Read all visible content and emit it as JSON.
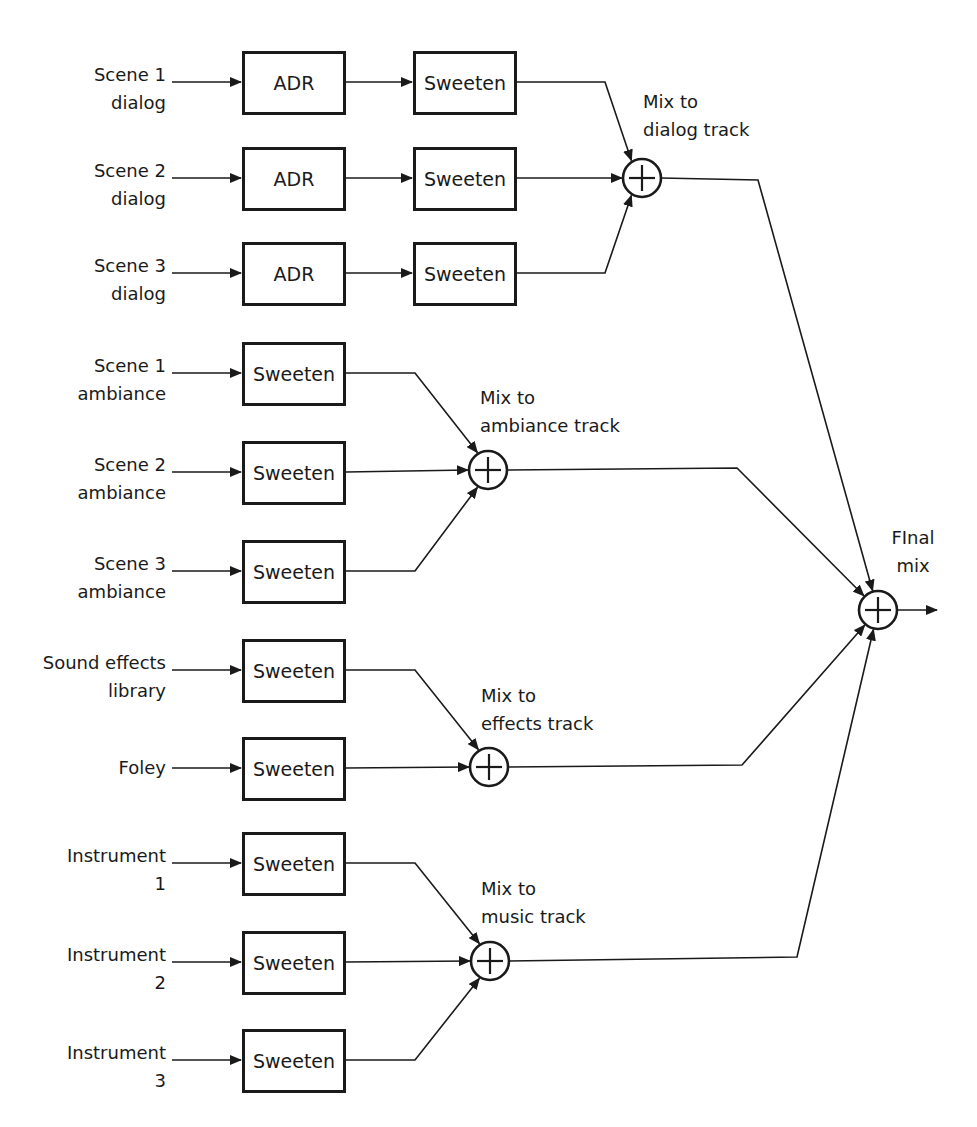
{
  "diagram": {
    "colors": {
      "stroke": "#1a1a1a",
      "background": "#ffffff"
    },
    "groups": [
      {
        "name": "dialog",
        "sum_label": [
          "Mix to",
          "dialog track"
        ],
        "sum": {
          "cx": 642,
          "cy": 178
        },
        "label_pos": {
          "x": 643,
          "y": 88
        },
        "out_corner": {
          "x": 758,
          "y": 180
        },
        "inputs": [
          {
            "label": [
              "Scene 1",
              "dialog"
            ],
            "y": 82,
            "stages": [
              "ADR",
              "Sweeten"
            ]
          },
          {
            "label": [
              "Scene 2",
              "dialog"
            ],
            "y": 178,
            "stages": [
              "ADR",
              "Sweeten"
            ]
          },
          {
            "label": [
              "Scene 3",
              "dialog"
            ],
            "y": 273,
            "stages": [
              "ADR",
              "Sweeten"
            ]
          }
        ]
      },
      {
        "name": "ambiance",
        "sum_label": [
          "Mix to",
          "ambiance track"
        ],
        "sum": {
          "cx": 488,
          "cy": 470
        },
        "label_pos": {
          "x": 480,
          "y": 384
        },
        "out_corner": {
          "x": 737,
          "y": 468
        },
        "inputs": [
          {
            "label": [
              "Scene 1",
              "ambiance"
            ],
            "y": 373,
            "stages": [
              "Sweeten"
            ]
          },
          {
            "label": [
              "Scene 2",
              "ambiance"
            ],
            "y": 472,
            "stages": [
              "Sweeten"
            ]
          },
          {
            "label": [
              "Scene 3",
              "ambiance"
            ],
            "y": 571,
            "stages": [
              "Sweeten"
            ]
          }
        ]
      },
      {
        "name": "effects",
        "sum_label": [
          "Mix to",
          "effects track"
        ],
        "sum": {
          "cx": 489,
          "cy": 767
        },
        "label_pos": {
          "x": 481,
          "y": 682
        },
        "out_corner": {
          "x": 742,
          "y": 765
        },
        "inputs": [
          {
            "label": [
              "Sound effects",
              "library"
            ],
            "y": 670,
            "stages": [
              "Sweeten"
            ]
          },
          {
            "label": [
              "Foley"
            ],
            "y": 768,
            "stages": [
              "Sweeten"
            ]
          }
        ]
      },
      {
        "name": "music",
        "sum_label": [
          "Mix to",
          "music track"
        ],
        "sum": {
          "cx": 490,
          "cy": 961
        },
        "label_pos": {
          "x": 481,
          "y": 875
        },
        "out_corner": {
          "x": 797,
          "y": 957
        },
        "inputs": [
          {
            "label": [
              "Instrument",
              "1"
            ],
            "y": 863,
            "stages": [
              "Sweeten"
            ]
          },
          {
            "label": [
              "Instrument",
              "2"
            ],
            "y": 962,
            "stages": [
              "Sweeten"
            ]
          },
          {
            "label": [
              "Instrument",
              "3"
            ],
            "y": 1060,
            "stages": [
              "Sweeten"
            ]
          }
        ]
      }
    ],
    "final": {
      "label": [
        "FInal",
        "mix"
      ],
      "sum": {
        "cx": 878,
        "cy": 610
      },
      "label_pos": {
        "x": 913,
        "y": 524
      },
      "out_end_x": 937
    },
    "layout": {
      "label_right_x": 166,
      "arrow_start_x": 172,
      "stage_cols": [
        {
          "x": 242,
          "w": 104
        },
        {
          "x": 413,
          "w": 104
        }
      ],
      "box_h": 64,
      "sum_r": 19,
      "in_turn_x_2col": 605,
      "in_turn_x_1col": 415
    }
  }
}
